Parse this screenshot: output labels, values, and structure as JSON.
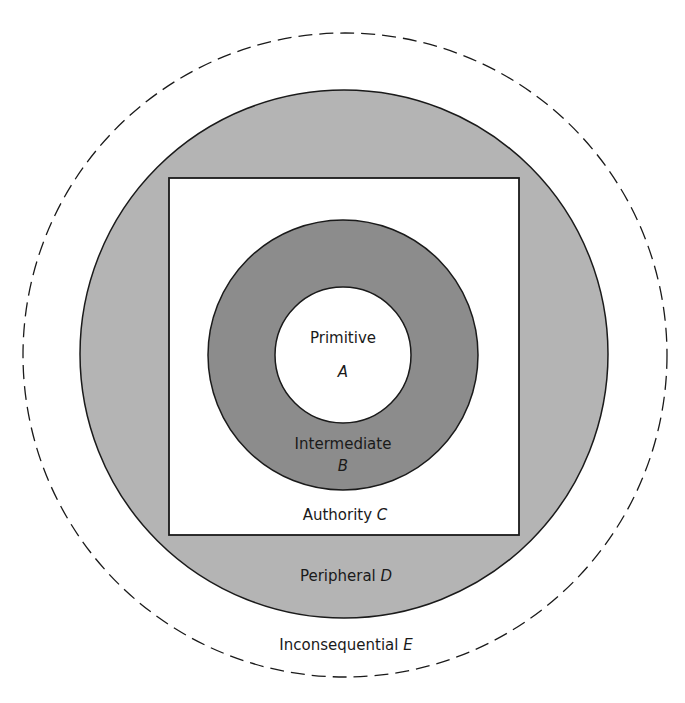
{
  "diagram": {
    "type": "nested-zones",
    "colors": {
      "background": "#ffffff",
      "peripheral_fill": "#b4b4b4",
      "intermediate_fill": "#8c8c8c",
      "stroke": "#1a1a1a"
    },
    "zones": {
      "primitive": {
        "name": "Primitive",
        "letter": "A"
      },
      "intermediate": {
        "name": "Intermediate",
        "letter": "B"
      },
      "authority": {
        "name": "Authority",
        "letter": "C"
      },
      "peripheral": {
        "name": "Peripheral",
        "letter": "D"
      },
      "inconsequential": {
        "name": "Inconsequential",
        "letter": "E"
      }
    }
  }
}
